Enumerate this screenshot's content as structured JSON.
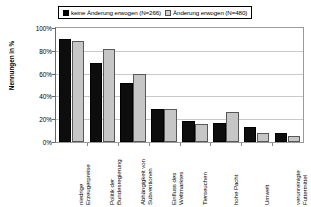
{
  "chart_data": {
    "type": "bar",
    "title": "",
    "subtitle": "",
    "xlabel": "",
    "ylabel": "Nennungen in %",
    "ylim": [
      0,
      100
    ],
    "yticks": [
      "0%",
      "20%",
      "40%",
      "60%",
      "80%",
      "100%"
    ],
    "ytick_values": [
      0,
      20,
      40,
      60,
      80,
      100
    ],
    "grid": true,
    "legend_position": "top-center",
    "categories": [
      "niedrige Erzeugerpreise",
      "Politik der Bundesregierung",
      "Abhängigkeit von Subventionen",
      "Einfluss des Weltmarktes",
      "Tierseuchen",
      "hohe Pacht",
      "Umwelt",
      "verunreinigte Futtermittel"
    ],
    "categories_wrapped": [
      "niedrige\nErzeugerpreise",
      "Politik der\nBundesregierung",
      "Abhängigkeit von\nSubventionen",
      "Einfluss des\nWeltmarktes",
      "Tierseuchen",
      "hohe Pacht",
      "Umwelt",
      "verunreinigte\nFuttermittel"
    ],
    "series": [
      {
        "name": "keine Änderung erwogen (N=266)",
        "short_name": "keine Änderung erwogen",
        "n": 266,
        "color": "#0d0d0d",
        "values": [
          90,
          69,
          52,
          29,
          18,
          17,
          13,
          8
        ]
      },
      {
        "name": "Änderung erwogen (N=480)",
        "short_name": "Änderung erwogen",
        "n": 480,
        "color": "#c6c6c6",
        "values": [
          89,
          82,
          60,
          29,
          16,
          26,
          8,
          5
        ]
      }
    ]
  },
  "legend": {
    "entries": [
      {
        "label": "keine Änderung erwogen (N=266)"
      },
      {
        "label": "Änderung erwogen (N=480)"
      }
    ]
  },
  "axes": {
    "y_title": "Nennungen in %"
  }
}
